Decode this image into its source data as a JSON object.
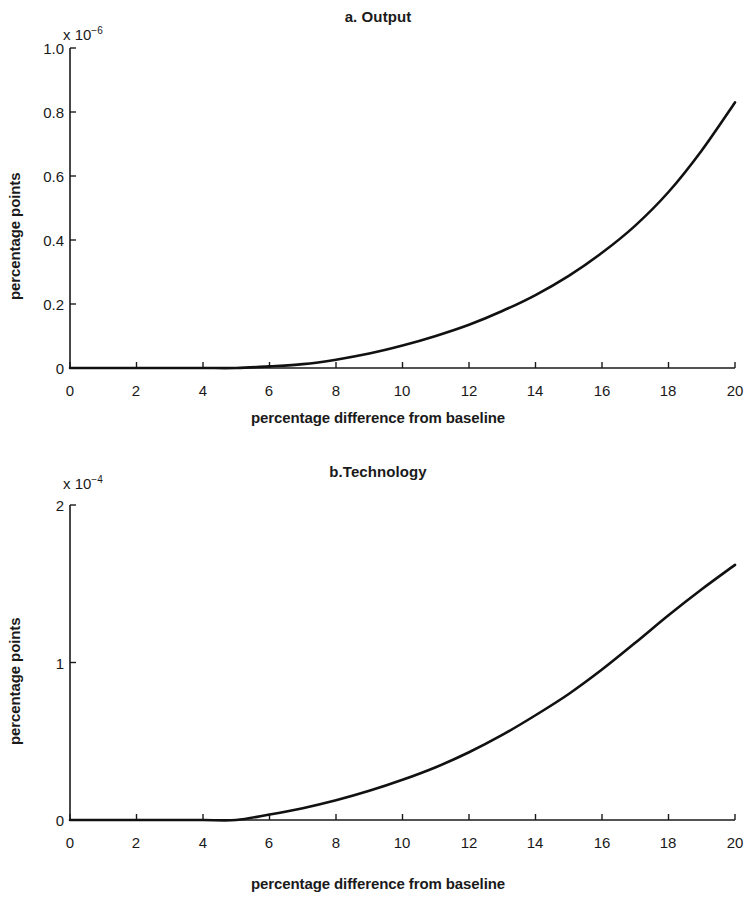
{
  "figure": {
    "ylabel": "percentage points",
    "xlabel": "percentage difference from baseline"
  },
  "panel_a": {
    "title": "a. Output",
    "exp_mantissa": "x 10",
    "exp_power": "−6",
    "yticks": [
      "1.0",
      "0.8",
      "0.6",
      "0.4",
      "0.2",
      "0"
    ],
    "xticks": [
      "0",
      "2",
      "4",
      "6",
      "8",
      "10",
      "12",
      "14",
      "16",
      "18",
      "20"
    ],
    "ylabel": "percentage points",
    "xlabel": "percentage difference from baseline"
  },
  "panel_b": {
    "title": "b.Technology",
    "exp_mantissa": "x 10",
    "exp_power": "−4",
    "yticks": [
      "2",
      "1",
      "0"
    ],
    "xticks": [
      "0",
      "2",
      "4",
      "6",
      "8",
      "10",
      "12",
      "14",
      "16",
      "18",
      "20"
    ],
    "ylabel": "percentage points",
    "xlabel": "percentage difference from baseline"
  },
  "chart_data": [
    {
      "type": "line",
      "panel": "a",
      "title": "a. Output",
      "xlabel": "percentage difference from baseline",
      "ylabel": "percentage points",
      "y_exponent": -6,
      "y_exponent_label": "x 10^-6",
      "xlim": [
        0,
        20
      ],
      "ylim": [
        0,
        1.0
      ],
      "xticks": [
        0,
        2,
        4,
        6,
        8,
        10,
        12,
        14,
        16,
        18,
        20
      ],
      "yticks": [
        0,
        0.2,
        0.4,
        0.6,
        0.8,
        1.0
      ],
      "grid": false,
      "legend": null,
      "series": [
        {
          "name": "Output",
          "x": [
            0,
            1,
            2,
            3,
            4,
            5,
            6,
            7,
            8,
            9,
            10,
            11,
            12,
            13,
            14,
            15,
            16,
            17,
            18,
            19,
            20
          ],
          "y": [
            0.0,
            0.0,
            0.0,
            0.0,
            0.0,
            0.0,
            0.005,
            0.012,
            0.026,
            0.045,
            0.07,
            0.1,
            0.135,
            0.178,
            0.228,
            0.288,
            0.36,
            0.445,
            0.55,
            0.68,
            0.83
          ]
        }
      ]
    },
    {
      "type": "line",
      "panel": "b",
      "title": "b.Technology",
      "xlabel": "percentage difference from baseline",
      "ylabel": "percentage points",
      "y_exponent": -4,
      "y_exponent_label": "x 10^-4",
      "xlim": [
        0,
        20
      ],
      "ylim": [
        0,
        2
      ],
      "xticks": [
        0,
        2,
        4,
        6,
        8,
        10,
        12,
        14,
        16,
        18,
        20
      ],
      "yticks": [
        0,
        1,
        2
      ],
      "grid": false,
      "legend": null,
      "series": [
        {
          "name": "Technology",
          "x": [
            0,
            1,
            2,
            3,
            4,
            5,
            6,
            7,
            8,
            9,
            10,
            11,
            12,
            13,
            14,
            15,
            16,
            17,
            18,
            19,
            20
          ],
          "y": [
            0.0,
            0.0,
            0.0,
            0.0,
            0.0,
            0.0,
            0.035,
            0.075,
            0.125,
            0.185,
            0.255,
            0.335,
            0.43,
            0.54,
            0.665,
            0.8,
            0.955,
            1.125,
            1.3,
            1.465,
            1.62
          ]
        }
      ]
    }
  ]
}
